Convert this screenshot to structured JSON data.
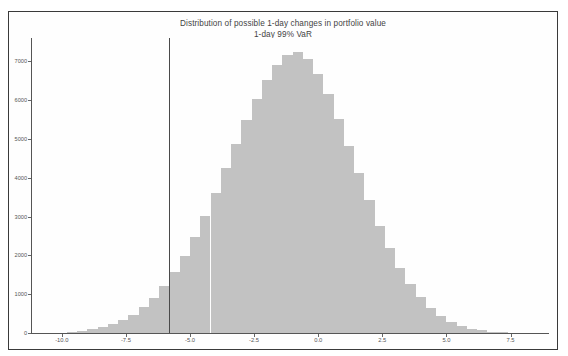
{
  "figure": {
    "background_color": "#fefefe",
    "frame_color": "#3a3a3a",
    "bar_color": "#c2c2c2",
    "var_line_color": "#4a4a4a",
    "axis_color": "#555555"
  },
  "chart_data": {
    "type": "bar",
    "title": "Distribution of possible 1-day changes in portfolio value",
    "subtitle": "1-day 99% VaR",
    "xlabel": "",
    "ylabel": "",
    "xlim": [
      -11.2,
      9.0
    ],
    "ylim": [
      0,
      7600
    ],
    "grid": false,
    "legend": null,
    "xticks": [
      -10.0,
      -7.5,
      -5.0,
      -2.5,
      0.0,
      2.5,
      5.0,
      7.5
    ],
    "xtick_labels": [
      "-10.0",
      "-7.5",
      "-5.0",
      "-2.5",
      "0.0",
      "2.5",
      "5.0",
      "7.5"
    ],
    "yticks": [
      0,
      1000,
      2000,
      3000,
      4000,
      5000,
      6000,
      7000
    ],
    "ytick_labels": [
      "0",
      "1000",
      "2000",
      "3000",
      "4000",
      "5000",
      "6000",
      "7000"
    ],
    "annotations": [
      {
        "name": "var-threshold-line",
        "type": "vline",
        "x": -5.8,
        "label": "1-day 99% VaR"
      }
    ],
    "bin_width": 0.4,
    "bin_centers": [
      -9.6,
      -9.2,
      -8.8,
      -8.4,
      -8.0,
      -7.6,
      -7.2,
      -6.8,
      -6.4,
      -6.0,
      -5.6,
      -5.2,
      -4.8,
      -4.4,
      -4.0,
      -3.6,
      -3.2,
      -2.8,
      -2.4,
      -2.0,
      -1.6,
      -1.2,
      -0.8,
      -0.4,
      0.0,
      0.4,
      0.8,
      1.2,
      1.6,
      2.0,
      2.4,
      2.8,
      3.2,
      3.6,
      4.0,
      4.4,
      4.8,
      5.2,
      5.6,
      6.0,
      6.4,
      6.8,
      7.2,
      7.6
    ],
    "values": [
      30,
      55,
      95,
      150,
      230,
      340,
      470,
      660,
      900,
      1200,
      1560,
      1990,
      2480,
      3020,
      3620,
      4250,
      4880,
      5480,
      6030,
      6520,
      6900,
      7150,
      7230,
      7050,
      6680,
      6150,
      5520,
      4830,
      4120,
      3420,
      2760,
      2180,
      1680,
      1260,
      920,
      650,
      440,
      290,
      185,
      115,
      68,
      38,
      20,
      10
    ]
  }
}
